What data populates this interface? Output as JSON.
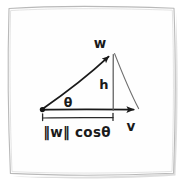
{
  "figure": {
    "kind": "hand-drawn-vector-projection-diagram",
    "background_color": "#ffffff",
    "paper_fill": "#fefefe",
    "frame_stroke": "#b9b9b9",
    "ink_color": "#1a1a1a",
    "ink_color_light": "#6f6f6f",
    "shadow_color": "#cfcfcf"
  },
  "labels": {
    "w_vector": "w",
    "v_vector": "v",
    "height": "h",
    "angle": "θ",
    "projection": "‖w‖ cosθ"
  },
  "geometry": {
    "origin": {
      "x": 42,
      "y": 110
    },
    "apex": {
      "x": 113,
      "y": 52
    },
    "v_tip": {
      "x": 143,
      "y": 110
    },
    "foot": {
      "x": 113,
      "y": 110
    },
    "bracket": {
      "x1": 42,
      "x2": 113,
      "y": 119,
      "tick_height": 6
    },
    "frame": {
      "x": 8,
      "y": 7,
      "width": 166,
      "height": 166
    }
  },
  "elements": {
    "w_arrow_name": "w-vector-arrow",
    "v_arrow_name": "v-vector-arrow",
    "h_line_name": "height-segment",
    "hyp_line_name": "hypotenuse-segment",
    "origin_dot_name": "origin-point",
    "bracket_name": "projection-bracket"
  }
}
